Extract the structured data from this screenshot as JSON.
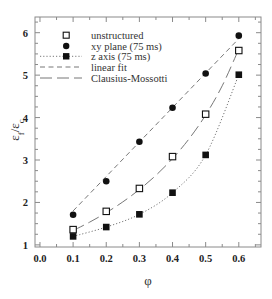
{
  "chart_data": {
    "type": "scatter",
    "title": "",
    "xlabel": "φ",
    "ylabel": "εf/εc",
    "ylabel_parts": [
      {
        "t": "ε",
        "sub": false
      },
      {
        "t": "f",
        "sub": true
      },
      {
        "t": "/",
        "sub": false
      },
      {
        "t": "ε",
        "sub": false
      },
      {
        "t": "c",
        "sub": true
      }
    ],
    "xlim": [
      -0.015,
      0.667
    ],
    "ylim": [
      0.95,
      6.37
    ],
    "x_ticks": [
      0.0,
      0.1,
      0.2,
      0.3,
      0.4,
      0.5,
      0.6
    ],
    "x_tick_labels": [
      "0.0",
      "0.1",
      "0.2",
      "0.3",
      "0.4",
      "0.5",
      "0.6"
    ],
    "x_minor_step": 0.05,
    "y_ticks": [
      1,
      2,
      3,
      4,
      5,
      6
    ],
    "y_tick_labels": [
      "1",
      "2",
      "3",
      "4",
      "5",
      "6"
    ],
    "y_minor_step": 0.25,
    "grid": false,
    "legend_position": "upper left",
    "colors": {
      "marker": "#111111",
      "line": "#777777",
      "axis": "#8a8a8a",
      "text": "#222222"
    },
    "series": [
      {
        "name": "unstructured",
        "marker": "open-square",
        "line": "none",
        "x": [
          0.1,
          0.2,
          0.3,
          0.4,
          0.5,
          0.6
        ],
        "y": [
          1.36,
          1.79,
          2.33,
          3.08,
          4.08,
          5.58
        ]
      },
      {
        "name": "xy plane (75 ms)",
        "marker": "filled-circle",
        "line": "none",
        "x": [
          0.1,
          0.2,
          0.3,
          0.4,
          0.5,
          0.6
        ],
        "y": [
          1.71,
          2.5,
          3.43,
          4.23,
          5.04,
          5.93
        ]
      },
      {
        "name": "z axis (75 ms)",
        "marker": "filled-square",
        "line": "dotted",
        "x": [
          0.1,
          0.2,
          0.3,
          0.4,
          0.5,
          0.6
        ],
        "y": [
          1.2,
          1.42,
          1.72,
          2.23,
          3.12,
          5.01
        ]
      },
      {
        "name": "linear fit",
        "marker": "none",
        "line": "dashed",
        "x": [
          0.1,
          0.6
        ],
        "y": [
          1.8,
          5.86
        ]
      },
      {
        "name": "Clausius-Mossotti",
        "marker": "none",
        "line": "long-dash",
        "x": [
          0.1,
          0.15,
          0.2,
          0.25,
          0.3,
          0.35,
          0.4,
          0.45,
          0.5,
          0.55,
          0.6
        ],
        "y": [
          1.337,
          1.536,
          1.759,
          2.013,
          2.304,
          2.64,
          3.034,
          3.5,
          4.061,
          4.749,
          5.614
        ]
      }
    ]
  }
}
